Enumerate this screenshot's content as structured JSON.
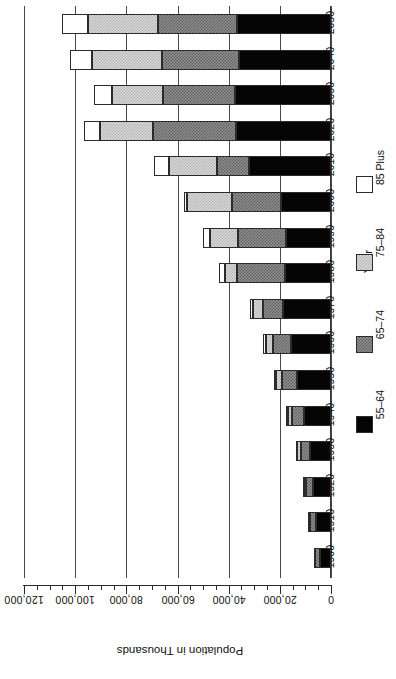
{
  "chart_data": {
    "type": "bar",
    "orientation": "horizontal-rotated-180",
    "title": "",
    "xlabel": "Population in Thousands",
    "ylabel": "Year",
    "xlim": [
      0,
      120000
    ],
    "grid": true,
    "legend_position": "right",
    "value_ticks": [
      "0",
      "20,000",
      "40,000",
      "60,000",
      "80,000",
      "100,000",
      "120,000"
    ],
    "value_tick_numbers": [
      0,
      20000,
      40000,
      60000,
      80000,
      100000,
      120000
    ],
    "minor_tick_step": 5000,
    "categories": [
      "1900",
      "1910",
      "1920",
      "1930",
      "1940",
      "1950",
      "1960",
      "1970",
      "1980",
      "1990",
      "2000",
      "2010",
      "2020",
      "2030",
      "2040",
      "2050"
    ],
    "series": [
      {
        "name": "55-64",
        "color": "#050505",
        "fill": "solid-black",
        "values": [
          4300,
          5800,
          6900,
          8300,
          10600,
          13300,
          15600,
          18600,
          18000,
          17600,
          19500,
          32000,
          37200,
          37500,
          36000,
          36800
        ]
      },
      {
        "name": "65-74",
        "color": "#8f8f8f",
        "fill": "medium-gray-hatch",
        "values": [
          1800,
          2300,
          2800,
          3600,
          4700,
          6000,
          7000,
          8000,
          18700,
          18800,
          19200,
          12700,
          32400,
          28000,
          30000,
          30900
        ]
      },
      {
        "name": "75-84",
        "color": "#d8d8d8",
        "fill": "light-gray-hatch",
        "values": [
          600,
          800,
          1000,
          1300,
          1700,
          2200,
          2900,
          3800,
          4700,
          10800,
          17500,
          18500,
          20500,
          20000,
          27500,
          27300
        ]
      },
      {
        "name": "85 Plus",
        "color": "#ffffff",
        "fill": "white",
        "values": [
          100,
          200,
          200,
          300,
          400,
          600,
          900,
          1400,
          2300,
          2800,
          1200,
          6000,
          6600,
          7000,
          8600,
          10200
        ]
      }
    ],
    "legend_entries": [
      {
        "label": "85 Plus",
        "fill": "white"
      },
      {
        "label": "75–84",
        "fill": "light-gray-hatch"
      },
      {
        "label": "65–74",
        "fill": "medium-gray-hatch"
      },
      {
        "label": "55–64",
        "fill": "solid-black"
      }
    ]
  },
  "axes": {
    "value_axis_title": "Population in Thousands",
    "category_axis_title": "Year"
  }
}
